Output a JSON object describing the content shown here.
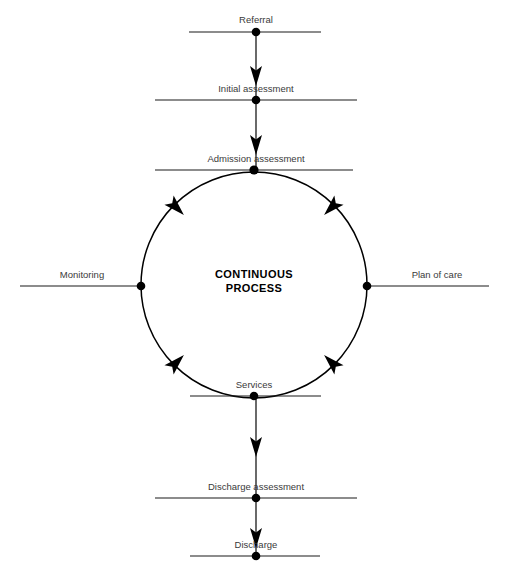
{
  "diagram": {
    "center_text_line1": "CONTINUOUS",
    "center_text_line2": "PROCESS",
    "line_color": "#1a1a1a",
    "label_color": "#3a3a3a",
    "center_color": "#000000",
    "background": "#ffffff",
    "flow_direction": "clockwise",
    "nodes": [
      {
        "id": "referral",
        "label": "Referral",
        "x": 256,
        "y": 32,
        "bar_x1": 189,
        "bar_x2": 321,
        "label_y": 23,
        "type": "linear"
      },
      {
        "id": "initial-assessment",
        "label": "Initial assessment",
        "x": 256,
        "y": 100,
        "bar_x1": 155,
        "bar_x2": 357,
        "label_y": 91,
        "type": "linear"
      },
      {
        "id": "admission-assessment",
        "label": "Admission assessment",
        "x": 254,
        "y": 170,
        "bar_x1": 155,
        "bar_x2": 353,
        "label_y": 161,
        "type": "cycle-top"
      },
      {
        "id": "plan-of-care",
        "label": "Plan of care",
        "x": 367,
        "y": 286,
        "bar_x1": 367,
        "bar_x2": 489,
        "label_y": 277,
        "type": "cycle-right"
      },
      {
        "id": "services",
        "label": "Services",
        "x": 254,
        "y": 396,
        "bar_x1": 190,
        "bar_x2": 321,
        "label_y": 387,
        "type": "cycle-bottom"
      },
      {
        "id": "monitoring",
        "label": "Monitoring",
        "x": 141,
        "y": 286,
        "bar_x1": 20,
        "bar_x2": 141,
        "label_y": 277,
        "type": "cycle-left"
      },
      {
        "id": "discharge-assessment",
        "label": "Discharge assessment",
        "x": 256,
        "y": 498,
        "bar_x1": 155,
        "bar_x2": 357,
        "label_y": 489,
        "type": "linear"
      },
      {
        "id": "discharge",
        "label": "Discharge",
        "x": 256,
        "y": 556,
        "bar_x1": 190,
        "bar_x2": 320,
        "label_y": 547,
        "type": "linear"
      }
    ],
    "vertical_flows": [
      {
        "id": "referral-to-initial",
        "from": "referral",
        "to": "initial-assessment",
        "x": 256,
        "y1": 32,
        "y2": 100
      },
      {
        "id": "initial-to-admission",
        "from": "initial-assessment",
        "to": "admission-assessment",
        "x": 256,
        "y1": 100,
        "y2": 170
      },
      {
        "id": "services-to-discharge-assess",
        "from": "services",
        "to": "discharge-assessment",
        "x": 256,
        "y1": 396,
        "y2": 498
      },
      {
        "id": "discharge-assess-to-discharge",
        "from": "discharge-assessment",
        "to": "discharge",
        "x": 256,
        "y1": 498,
        "y2": 556
      }
    ],
    "cycle": {
      "center_x": 254,
      "center_y": 285,
      "radius": 113,
      "arrow_angles_deg": [
        315,
        45,
        135,
        225
      ],
      "segments": [
        {
          "id": "arc-admission-to-plan",
          "from": "admission-assessment",
          "to": "plan-of-care"
        },
        {
          "id": "arc-plan-to-services",
          "from": "plan-of-care",
          "to": "services"
        },
        {
          "id": "arc-services-to-monitoring",
          "from": "services",
          "to": "monitoring"
        },
        {
          "id": "arc-monitoring-to-admission",
          "from": "monitoring",
          "to": "admission-assessment"
        }
      ]
    }
  }
}
